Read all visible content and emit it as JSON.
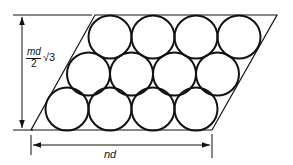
{
  "diagram": {
    "rows": 3,
    "circles_per_row": 4,
    "height_label": {
      "numerator": "md",
      "denominator": "2",
      "radical": "√3"
    },
    "width_label": "nd",
    "colors": {
      "stroke": "#111111",
      "background": "#ffffff"
    }
  }
}
